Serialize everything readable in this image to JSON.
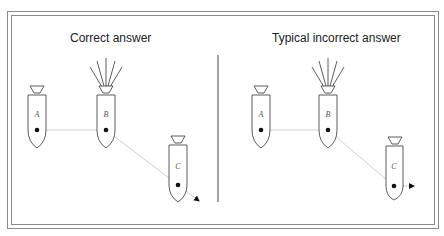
{
  "panels": [
    {
      "title": "Correct answer",
      "objects": [
        {
          "label": "A",
          "has_flare": false
        },
        {
          "label": "B",
          "has_flare": true
        },
        {
          "label": "C",
          "has_flare": false
        }
      ],
      "path": "straight line from A through B continuing on same diagonal past C"
    },
    {
      "title": "Typical incorrect answer",
      "objects": [
        {
          "label": "A",
          "has_flare": false
        },
        {
          "label": "B",
          "has_flare": true
        },
        {
          "label": "C",
          "has_flare": false
        }
      ],
      "path": "line from A to B, diagonal to C, then horizontal arrow"
    }
  ],
  "colors": {
    "outline": "#333333",
    "path_line": "#c8c8c8",
    "dot": "#111111",
    "frame": "#8a8a8a"
  }
}
